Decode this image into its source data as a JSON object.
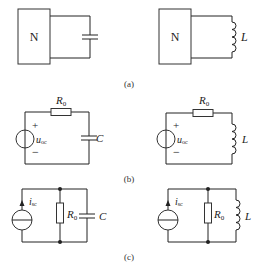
{
  "figure": {
    "panels": [
      {
        "id": "a",
        "caption": "(a)",
        "circuits": [
          {
            "name": "network-with-capacitor",
            "network_label": "N",
            "element": "capacitor",
            "element_label": ""
          },
          {
            "name": "network-with-inductor",
            "network_label": "N",
            "element": "inductor",
            "element_label": "L"
          }
        ]
      },
      {
        "id": "b",
        "caption": "(b)",
        "circuits": [
          {
            "name": "thevenin-rc",
            "source_label": "u",
            "source_sub": "oc",
            "plus": "+",
            "minus": "−",
            "resistor_label": "R",
            "resistor_sub": "0",
            "element": "capacitor",
            "element_label": "C"
          },
          {
            "name": "thevenin-rl",
            "source_label": "u",
            "source_sub": "oc",
            "plus": "+",
            "minus": "−",
            "resistor_label": "R",
            "resistor_sub": "0",
            "element": "inductor",
            "element_label": "L"
          }
        ]
      },
      {
        "id": "c",
        "caption": "(c)",
        "circuits": [
          {
            "name": "norton-rc",
            "source_label": "i",
            "source_sub": "sc",
            "resistor_label": "R",
            "resistor_sub": "0",
            "element": "capacitor",
            "element_label": "C"
          },
          {
            "name": "norton-rl",
            "source_label": "i",
            "source_sub": "sc",
            "resistor_label": "R",
            "resistor_sub": "0",
            "element": "inductor",
            "element_label": "L"
          }
        ]
      }
    ]
  }
}
